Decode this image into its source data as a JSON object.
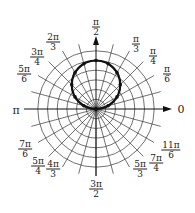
{
  "diagram": {
    "title": "",
    "type": "polar-graph",
    "center": [
      96,
      109
    ],
    "grid": {
      "rings": 6,
      "ring_spacing_px": 9.7,
      "spokes": 24,
      "spoke_step": "π/12",
      "spoke_length_px": 67,
      "color": "#333333"
    },
    "axes": {
      "zero_label": "0",
      "pi_label": "π",
      "arrow_color": "#111111"
    },
    "curve": {
      "description": "circle through the pole, symmetric about θ = π/2 (r = a·sin θ)",
      "max_r_rings": 5,
      "stroke": "#111111",
      "stroke_width": 2.2,
      "points_marked_every": "π/12"
    },
    "angle_labels": [
      {
        "id": "pi-over-2",
        "num": "π",
        "den": "2",
        "x": 96,
        "y": 27
      },
      {
        "id": "two-pi-over-3",
        "num": "2π",
        "den": "3",
        "x": 53,
        "y": 42
      },
      {
        "id": "three-pi-over-4",
        "num": "3π",
        "den": "4",
        "x": 37,
        "y": 57
      },
      {
        "id": "five-pi-over-6",
        "num": "5π",
        "den": "6",
        "x": 24,
        "y": 74
      },
      {
        "id": "pi-over-3",
        "num": "π",
        "den": "3",
        "x": 136,
        "y": 44
      },
      {
        "id": "pi-over-4",
        "num": "π",
        "den": "4",
        "x": 153,
        "y": 56
      },
      {
        "id": "pi-over-6",
        "num": "π",
        "den": "6",
        "x": 167,
        "y": 74
      },
      {
        "id": "seven-pi-over-6",
        "num": "7π",
        "den": "6",
        "x": 25,
        "y": 149
      },
      {
        "id": "five-pi-over-4",
        "num": "5π",
        "den": "4",
        "x": 38,
        "y": 166
      },
      {
        "id": "four-pi-over-3",
        "num": "4π",
        "den": "3",
        "x": 53,
        "y": 169
      },
      {
        "id": "three-pi-over-2",
        "num": "3π",
        "den": "2",
        "x": 96,
        "y": 189
      },
      {
        "id": "five-pi-over-3",
        "num": "5π",
        "den": "3",
        "x": 140,
        "y": 169
      },
      {
        "id": "seven-pi-over-4",
        "num": "7π",
        "den": "4",
        "x": 156,
        "y": 163
      },
      {
        "id": "eleven-pi-over-6",
        "num": "11π",
        "den": "6",
        "x": 171,
        "y": 150
      }
    ],
    "plain_labels": [
      {
        "id": "zero",
        "text": "0",
        "x": 181,
        "y": 109
      },
      {
        "id": "pi",
        "text": "π",
        "x": 16,
        "y": 110
      }
    ]
  }
}
